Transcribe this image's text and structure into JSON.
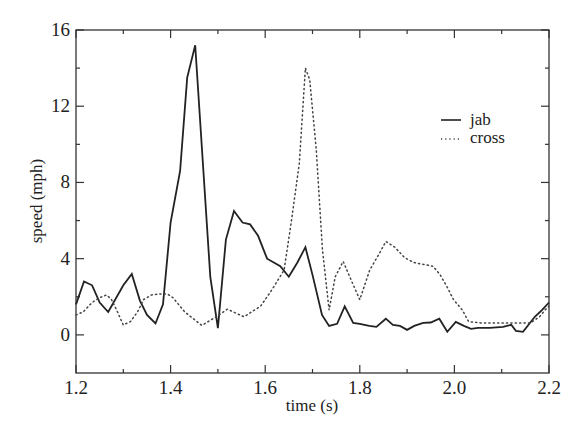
{
  "chart_data": {
    "type": "line",
    "title": "",
    "xlabel": "time (s)",
    "ylabel": "speed (mph)",
    "xlim": [
      1.2,
      2.2
    ],
    "ylim": [
      -2,
      16
    ],
    "xticks": [
      1.2,
      1.4,
      1.6,
      1.8,
      2.0,
      2.2
    ],
    "xtick_labels": [
      "1.2",
      "1.4",
      "1.6",
      "1.8",
      "2.0",
      "2.2"
    ],
    "xminor_ticks": [
      1.3,
      1.5,
      1.7,
      1.9,
      2.1
    ],
    "yticks": [
      0,
      4,
      8,
      12,
      16
    ],
    "ytick_labels": [
      "0",
      "4",
      "8",
      "12",
      "16"
    ],
    "yminor_ticks": [
      2,
      6,
      10,
      14
    ],
    "grid": false,
    "legend_position": "upper right (inside)",
    "series": [
      {
        "name": "jab",
        "style": "solid",
        "color": "#222222",
        "x": [
          1.2,
          1.217,
          1.234,
          1.25,
          1.268,
          1.3,
          1.318,
          1.335,
          1.35,
          1.368,
          1.384,
          1.4,
          1.42,
          1.435,
          1.452,
          1.484,
          1.5,
          1.517,
          1.534,
          1.552,
          1.568,
          1.585,
          1.604,
          1.632,
          1.65,
          1.668,
          1.685,
          1.7,
          1.72,
          1.735,
          1.752,
          1.768,
          1.786,
          1.8,
          1.82,
          1.835,
          1.855,
          1.87,
          1.885,
          1.9,
          1.915,
          1.934,
          1.95,
          1.968,
          1.985,
          2.003,
          2.02,
          2.035,
          2.05,
          2.075,
          2.103,
          2.12,
          2.13,
          2.145,
          2.17,
          2.185,
          2.2
        ],
        "values": [
          1.6,
          2.8,
          2.6,
          1.7,
          1.2,
          2.6,
          3.2,
          1.8,
          1.05,
          0.6,
          1.6,
          5.9,
          8.6,
          13.5,
          15.2,
          3.05,
          0.35,
          5.0,
          6.5,
          5.9,
          5.8,
          5.2,
          4.0,
          3.6,
          3.05,
          3.8,
          4.6,
          3.15,
          1.05,
          0.47,
          0.58,
          1.5,
          0.63,
          0.58,
          0.47,
          0.42,
          0.85,
          0.52,
          0.47,
          0.26,
          0.47,
          0.63,
          0.65,
          0.85,
          0.16,
          0.68,
          0.47,
          0.32,
          0.37,
          0.37,
          0.42,
          0.53,
          0.21,
          0.16,
          0.95,
          1.3,
          1.7
        ]
      },
      {
        "name": "cross",
        "style": "dotted",
        "color": "#444444",
        "x": [
          1.2,
          1.215,
          1.234,
          1.25,
          1.265,
          1.275,
          1.286,
          1.3,
          1.315,
          1.33,
          1.343,
          1.36,
          1.378,
          1.393,
          1.405,
          1.43,
          1.466,
          1.5,
          1.52,
          1.555,
          1.59,
          1.615,
          1.64,
          1.655,
          1.672,
          1.685,
          1.694,
          1.708,
          1.721,
          1.735,
          1.748,
          1.765,
          1.784,
          1.8,
          1.821,
          1.842,
          1.855,
          1.874,
          1.895,
          1.914,
          1.935,
          1.955,
          1.97,
          1.985,
          1.998,
          2.017,
          2.03,
          2.055,
          2.097,
          2.14,
          2.161,
          2.18,
          2.195,
          2.2
        ],
        "values": [
          1.05,
          1.2,
          1.7,
          1.95,
          2.1,
          1.85,
          1.3,
          0.52,
          0.7,
          1.2,
          1.85,
          2.1,
          2.15,
          2.15,
          1.95,
          1.2,
          0.5,
          1.0,
          1.35,
          0.95,
          1.5,
          2.4,
          3.4,
          5.9,
          9.0,
          14.0,
          13.4,
          9.7,
          4.5,
          1.3,
          3.05,
          3.85,
          2.75,
          1.85,
          3.4,
          4.3,
          4.9,
          4.6,
          4.05,
          3.8,
          3.7,
          3.6,
          3.15,
          2.5,
          1.85,
          1.3,
          0.7,
          0.63,
          0.63,
          0.63,
          0.63,
          0.95,
          1.4,
          1.5
        ]
      }
    ]
  }
}
